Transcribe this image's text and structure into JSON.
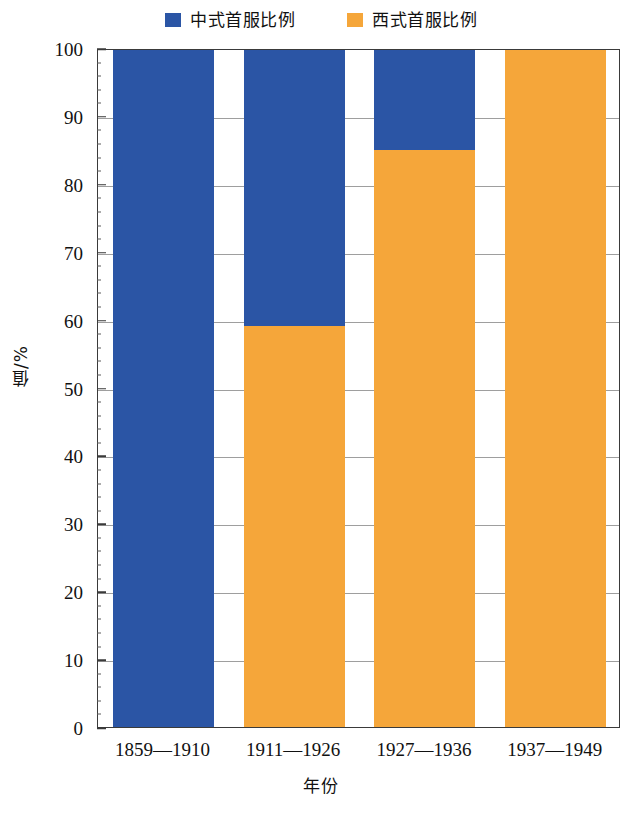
{
  "chart_data": {
    "type": "bar",
    "variant": "stacked-vertical-100percent",
    "title": "",
    "xlabel": "年份",
    "ylabel": "值/%",
    "ylim": [
      0,
      100
    ],
    "ytick_step": 10,
    "yticks": [
      0,
      10,
      20,
      30,
      40,
      50,
      60,
      70,
      80,
      90,
      100
    ],
    "ytick_labels": [
      "0",
      "10",
      "20",
      "30",
      "40",
      "50",
      "60",
      "70",
      "80",
      "90",
      "100"
    ],
    "minor_tick_step": 2,
    "grid": true,
    "grid_axis": "y",
    "legend_position": "top-center",
    "categories": [
      "1859—1910",
      "1911—1926",
      "1927—1936",
      "1937—1949"
    ],
    "series": [
      {
        "name": "中式首服比例",
        "color": "#2B55A5",
        "values": [
          100,
          41,
          15,
          0
        ]
      },
      {
        "name": "西式首服比例",
        "color": "#F5A63A",
        "values": [
          0,
          59,
          85,
          100
        ]
      }
    ],
    "stack_boundaries_percent": [
      100,
      59,
      85,
      100
    ]
  },
  "legend": {
    "entries": [
      {
        "label": "中式首服比例",
        "color": "#2B55A5",
        "swatch_icon": "legend-square-icon"
      },
      {
        "label": "西式首服比例",
        "color": "#F5A63A",
        "swatch_icon": "legend-square-icon"
      }
    ]
  },
  "axes": {
    "y": {
      "label": "值/%",
      "tick_labels": [
        "100",
        "90",
        "80",
        "70",
        "60",
        "50",
        "40",
        "30",
        "20",
        "10",
        "0"
      ]
    },
    "x": {
      "label": "年份",
      "tick_labels": [
        "1859—1910",
        "1911—1926",
        "1927—1936",
        "1937—1949"
      ]
    }
  },
  "colors": {
    "series_blue": "#2B55A5",
    "series_orange": "#F5A63A",
    "axis": "#3a3a3a",
    "grid": "#8d8d8d",
    "background": "#ffffff",
    "text": "#111111"
  }
}
